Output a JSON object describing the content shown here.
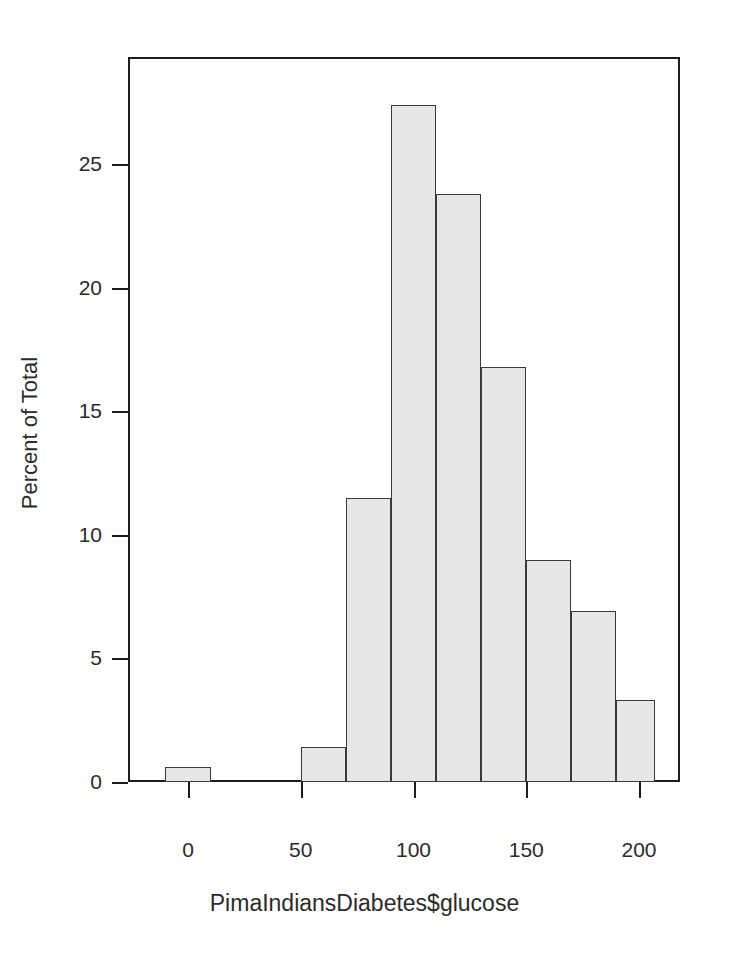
{
  "chart_data": {
    "type": "bar",
    "title": "",
    "subtitle": "",
    "xlabel": "PimaIndiansDiabetes$glucose",
    "ylabel": "Percent of Total",
    "grid": false,
    "legend": false,
    "legend_position": "none",
    "xlim": [
      -10,
      210
    ],
    "ylim": [
      0,
      28.8
    ],
    "xticks": [
      0,
      50,
      100,
      150,
      200
    ],
    "xtick_labels": [
      "0",
      "50",
      "100",
      "150",
      "200"
    ],
    "yticks": [
      0,
      5,
      10,
      15,
      20,
      25
    ],
    "ytick_labels": [
      "0",
      "5",
      "10",
      "15",
      "20",
      "25"
    ],
    "bin_width": 20,
    "categories": [
      "0-20",
      "20-40",
      "40-60",
      "60-80",
      "80-100",
      "100-120",
      "120-140",
      "140-160",
      "160-180",
      "180-200",
      "200-220"
    ],
    "bins": [
      {
        "x0": -10,
        "x1": 10,
        "value": 0.6
      },
      {
        "x0": 10,
        "x1": 30,
        "value": 0.0
      },
      {
        "x0": 30,
        "x1": 50,
        "value": 0.0
      },
      {
        "x0": 50,
        "x1": 70,
        "value": 1.4
      },
      {
        "x0": 70,
        "x1": 90,
        "value": 11.5
      },
      {
        "x0": 90,
        "x1": 110,
        "value": 27.4
      },
      {
        "x0": 110,
        "x1": 130,
        "value": 23.8
      },
      {
        "x0": 130,
        "x1": 150,
        "value": 16.8
      },
      {
        "x0": 150,
        "x1": 170,
        "value": 9.0
      },
      {
        "x0": 170,
        "x1": 190,
        "value": 6.9
      },
      {
        "x0": 190,
        "x1": 207,
        "value": 3.3
      }
    ],
    "values": [
      0.6,
      0.0,
      0.0,
      1.4,
      11.5,
      27.4,
      23.8,
      16.8,
      9.0,
      6.9,
      3.3
    ],
    "colors": {
      "bar_fill": "#e7e7e7",
      "bar_border": "#3a3a3a",
      "axis": "#1d1d1d",
      "text": "#2b2b2b",
      "background": "#ffffff"
    }
  }
}
